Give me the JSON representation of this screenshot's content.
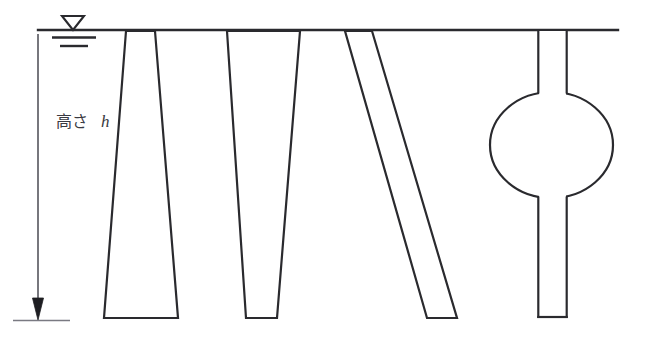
{
  "figure": {
    "title": "",
    "background_color": "#ffffff",
    "line_color": "#2a2a2e",
    "text_color": "#3a3a42"
  },
  "labels": {
    "height_label_jp": "高さ",
    "height_label_symbol": "h"
  },
  "ground_line": {
    "name": "ground-surface-line",
    "x1": 38,
    "x2": 618,
    "y": 30,
    "stroke_width": 2.2
  },
  "water_table_symbol": {
    "name": "water-table-symbol",
    "triangle": {
      "cx": 73,
      "top_y": 16,
      "half_width": 11,
      "apex_y": 30
    },
    "hatch_lines": [
      {
        "x1": 52,
        "x2": 96,
        "y": 37
      },
      {
        "x1": 60,
        "x2": 88,
        "y": 45
      }
    ]
  },
  "dimension": {
    "name": "height-dimension-line",
    "x": 38,
    "top_y": 34,
    "bottom_y": 318,
    "arrow_half_width": 5,
    "arrow_length": 17,
    "base_tick": {
      "x1": 13,
      "x2": 70,
      "y": 320
    },
    "label_x": 58,
    "label_y": 126
  },
  "piles": [
    {
      "name": "pile-flared-base",
      "type": "inverted-trapezoid",
      "description": "under-reamed pile, narrow head widening to base",
      "top_left_x": 126,
      "top_right_x": 155,
      "bottom_left_x": 104,
      "bottom_right_x": 178,
      "top_y": 30,
      "bottom_y": 318
    },
    {
      "name": "pile-tapered",
      "type": "tapered-trapezoid",
      "description": "tapered pile, wide head narrowing to tip",
      "top_left_x": 227,
      "top_right_x": 300,
      "bottom_left_x": 246,
      "bottom_right_x": 277,
      "top_y": 30,
      "bottom_y": 318
    },
    {
      "name": "pile-raked",
      "type": "parallelogram",
      "description": "raked or battered pile, inclined shaft",
      "top_left_x": 345,
      "top_right_x": 372,
      "bottom_left_x": 427,
      "bottom_right_x": 457,
      "top_y": 30,
      "bottom_y": 318
    },
    {
      "name": "pile-bulbed",
      "type": "shaft-with-bulb",
      "description": "pile with enlarged bulb at mid depth",
      "shaft_left_x": 538,
      "shaft_right_x": 567,
      "top_y": 30,
      "bottom_y": 318,
      "bulb": {
        "cx": 551,
        "cy": 145,
        "rx": 62,
        "ry": 53,
        "top_y": 92,
        "bottom_y": 198
      }
    }
  ]
}
